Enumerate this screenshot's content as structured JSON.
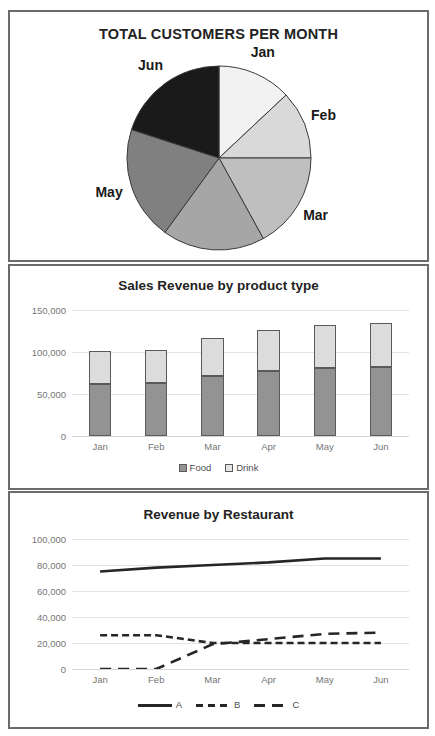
{
  "colors": {
    "frame": "#6b6b6b",
    "grid": "#e2e2e2",
    "tick_text": "#767676",
    "title_text": "#232323",
    "food": "#939393",
    "drink": "#dcdcdc",
    "line_a": "#262626",
    "line_b": "#262626",
    "line_c": "#262626",
    "pie_jan": "#f2f2f2",
    "pie_feb": "#d9d9d9",
    "pie_mar": "#bfbfbf",
    "pie_apr": "#a6a6a6",
    "pie_may": "#808080",
    "pie_jun": "#1a1a1a"
  },
  "pie_panel": {
    "title": "TOTAL CUSTOMERS PER MONTH",
    "labels": {
      "jan": "Jan",
      "feb": "Feb",
      "mar": "Mar",
      "apr": "Apr",
      "may": "May",
      "jun": "Jun"
    }
  },
  "bar_panel": {
    "title": "Sales Revenue by product type"
  },
  "line_panel": {
    "title": "Revenue by Restaurant"
  },
  "chart_data": [
    {
      "type": "pie",
      "title": "TOTAL CUSTOMERS PER MONTH",
      "categories": [
        "Jan",
        "Feb",
        "Mar",
        "Apr",
        "May",
        "Jun"
      ],
      "values": [
        13,
        12,
        17,
        18,
        20,
        20
      ],
      "unit": "percent",
      "start_angle_deg": 0,
      "direction": "clockwise",
      "slice_colors": [
        "#f2f2f2",
        "#d9d9d9",
        "#bfbfbf",
        "#a6a6a6",
        "#808080",
        "#1a1a1a"
      ],
      "labels_outside": true,
      "legend": "none"
    },
    {
      "type": "bar",
      "subtype": "stacked",
      "title": "Sales Revenue by product type",
      "categories": [
        "Jan",
        "Feb",
        "Mar",
        "Apr",
        "May",
        "Jun"
      ],
      "series": [
        {
          "name": "Food",
          "values": [
            62000,
            63000,
            71000,
            77000,
            81000,
            82000
          ]
        },
        {
          "name": "Drink",
          "values": [
            39000,
            40000,
            46000,
            49000,
            51000,
            52000
          ]
        }
      ],
      "totals": [
        101000,
        103000,
        117000,
        126000,
        132000,
        134000
      ],
      "ylabel": "",
      "xlabel": "",
      "ylim": [
        0,
        150000
      ],
      "yticks": [
        0,
        50000,
        100000,
        150000
      ],
      "ytick_labels": [
        "0",
        "50,000",
        "100,000",
        "150,000"
      ],
      "grid": true,
      "legend": [
        "Food",
        "Drink"
      ],
      "legend_position": "bottom"
    },
    {
      "type": "line",
      "title": "Revenue by Restaurant",
      "x": [
        "Jan",
        "Feb",
        "Mar",
        "Apr",
        "May",
        "Jun"
      ],
      "series": [
        {
          "name": "A",
          "style": "solid",
          "values": [
            75000,
            78000,
            80000,
            82000,
            85000,
            85000
          ]
        },
        {
          "name": "B",
          "style": "dashed",
          "values": [
            26000,
            26000,
            20000,
            20000,
            20000,
            20000
          ]
        },
        {
          "name": "C",
          "style": "long-dashed",
          "values": [
            0,
            0,
            19000,
            23000,
            27000,
            28000
          ]
        }
      ],
      "ylabel": "",
      "xlabel": "",
      "ylim": [
        0,
        100000
      ],
      "yticks": [
        0,
        20000,
        40000,
        60000,
        80000,
        100000
      ],
      "ytick_labels": [
        "0",
        "20,000",
        "40,000",
        "60,000",
        "80,000",
        "100,000"
      ],
      "grid": true,
      "legend": [
        "A",
        "B",
        "C"
      ],
      "legend_position": "bottom"
    }
  ]
}
